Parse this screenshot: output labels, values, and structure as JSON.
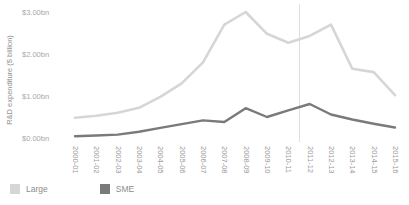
{
  "chart_data": {
    "type": "line",
    "title": "",
    "xlabel": "",
    "ylabel": "R&D expenditure ($ billion)",
    "ylim": [
      0,
      3
    ],
    "y_ticks": [
      "$0.00bn",
      "$1.00bn",
      "$2.00bn",
      "$3.00bn"
    ],
    "grid": "none",
    "legend_position": "bottom-left",
    "reference_line_between": [
      "2010-11",
      "2011-12"
    ],
    "categories": [
      "2000-01",
      "2001-02",
      "2002-03",
      "2003-04",
      "2004-05",
      "2005-06",
      "2006-07",
      "2007-08",
      "2008-09",
      "2009-10",
      "2010-11",
      "2011-12",
      "2012-13",
      "2013-14",
      "2014-15",
      "2015-16"
    ],
    "series": [
      {
        "name": "Large",
        "color": "#d6d6d6",
        "values": [
          0.48,
          0.53,
          0.6,
          0.72,
          0.98,
          1.3,
          1.8,
          2.7,
          3.0,
          2.48,
          2.27,
          2.43,
          2.7,
          1.65,
          1.57,
          1.02
        ]
      },
      {
        "name": "SME",
        "color": "#7a7a7a",
        "values": [
          0.04,
          0.06,
          0.08,
          0.15,
          0.24,
          0.33,
          0.42,
          0.38,
          0.71,
          0.5,
          0.66,
          0.81,
          0.56,
          0.44,
          0.34,
          0.25
        ]
      }
    ],
    "colors": {
      "reference_line": "#dedede",
      "axis_text": "#9a9a9a",
      "background": "#ffffff"
    }
  }
}
